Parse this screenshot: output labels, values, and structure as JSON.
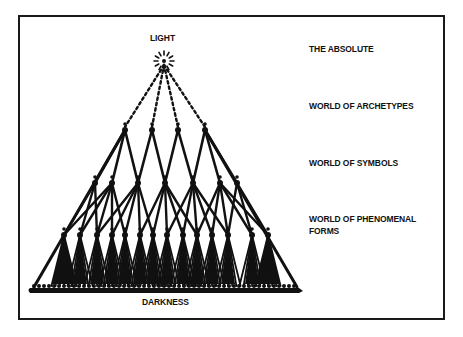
{
  "diagram": {
    "top_label": "LIGHT",
    "bottom_label": "DARKNESS",
    "levels": [
      {
        "label": "THE ABSOLUTE",
        "y": 43
      },
      {
        "label": "WORLD OF ARCHETYPES",
        "y": 99
      },
      {
        "label": "WORLD OF SYMBOLS",
        "y": 155
      },
      {
        "label": "WORLD OF PHENOMENAL",
        "label2": "FORMS",
        "y": 211
      }
    ],
    "apex": {
      "x": 164,
      "y": 61
    },
    "archetype_nodes": [
      125,
      152,
      178,
      205
    ],
    "archetype_y": 130,
    "symbol_nodes": [
      95,
      112,
      138,
      165,
      193,
      220,
      237
    ],
    "symbol_y": 183,
    "phenomenal_nodes": [
      64,
      80,
      97,
      112,
      125,
      140,
      153,
      167,
      183,
      197,
      212,
      228,
      252,
      268
    ],
    "phenomenal_y": 235,
    "base": {
      "x1": 30,
      "x2": 303,
      "y": 290
    },
    "colors": {
      "ink": "#111111",
      "frame": "#1a1a1a",
      "background": "#ffffff"
    }
  }
}
